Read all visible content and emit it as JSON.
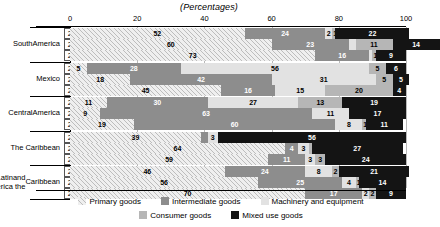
{
  "title": "(Percentages)",
  "axis": {
    "ticks": [
      0,
      20,
      40,
      60,
      80,
      100
    ],
    "min": 0,
    "max": 100
  },
  "legend": {
    "items": [
      {
        "label": "Primary goods",
        "key": "primary",
        "color": "#efefef"
      },
      {
        "label": "Intermediate goods",
        "key": "intermediate",
        "color": "#8d8d8d"
      },
      {
        "label": "Machinery and equipment",
        "key": "machinery",
        "color": "#e2e2e2"
      },
      {
        "label": "Consumer goods",
        "key": "consumer",
        "color": "#b6b6b6"
      },
      {
        "label": "Mixed use goods",
        "key": "mixed",
        "color": "#141414"
      }
    ]
  },
  "groups": [
    {
      "name": "South America",
      "label_lines": [
        "South",
        "America"
      ]
    },
    {
      "name": "Mexico",
      "label_lines": [
        "Mexico"
      ]
    },
    {
      "name": "Central America",
      "label_lines": [
        "Central",
        "America"
      ]
    },
    {
      "name": "The Caribbean",
      "label_lines": [
        "The Caribbean"
      ]
    },
    {
      "name": "Latin America and the Caribbean",
      "label_lines": [
        "Latin America",
        "and the",
        "Caribbean"
      ]
    }
  ],
  "chart_data": {
    "type": "bar",
    "orientation": "horizontal",
    "stacked": true,
    "title": "(Percentages)",
    "xlabel": "",
    "ylabel": "",
    "xlim": [
      0,
      100
    ],
    "grid": true,
    "legend_position": "bottom",
    "categories": [
      "Primary goods",
      "Intermediate goods",
      "Machinery and equipment",
      "Consumer goods",
      "Mixed use goods"
    ],
    "rows": [
      {
        "group": "South America",
        "year": "2000",
        "values": [
          52,
          24,
          2,
          1,
          22
        ],
        "labels": [
          "52",
          "24",
          "2",
          "1",
          "22"
        ]
      },
      {
        "group": "South America",
        "year": "2005",
        "values": [
          60,
          23,
          2,
          11,
          14
        ],
        "labels": [
          "60",
          "23",
          "",
          "11",
          "14"
        ]
      },
      {
        "group": "South America",
        "year": "2013",
        "values": [
          73,
          16,
          1,
          1,
          9
        ],
        "labels": [
          "73",
          "16",
          "",
          "1",
          "9"
        ]
      },
      {
        "group": "Mexico",
        "year": "2000",
        "values": [
          5,
          28,
          56,
          5,
          6
        ],
        "labels": [
          "5",
          "28",
          "56",
          "5",
          "6"
        ]
      },
      {
        "group": "Mexico",
        "year": "2005",
        "values": [
          18,
          42,
          31,
          5,
          5
        ],
        "labels": [
          "18",
          "42",
          "31",
          "5",
          "5"
        ]
      },
      {
        "group": "Mexico",
        "year": "2013",
        "values": [
          45,
          16,
          15,
          20,
          4
        ],
        "labels": [
          "45",
          "16",
          "15",
          "20",
          "4"
        ]
      },
      {
        "group": "Central America",
        "year": "2000",
        "values": [
          11,
          30,
          27,
          13,
          19
        ],
        "labels": [
          "11",
          "30",
          "27",
          "13",
          "19"
        ]
      },
      {
        "group": "Central America",
        "year": "2005",
        "values": [
          9,
          63,
          11,
          0,
          17
        ],
        "labels": [
          "9",
          "63",
          "11",
          "",
          "17"
        ]
      },
      {
        "group": "Central America",
        "year": "2013",
        "values": [
          19,
          60,
          8,
          1,
          11
        ],
        "labels": [
          "19",
          "60",
          "8",
          "1",
          "11"
        ]
      },
      {
        "group": "The Caribbean",
        "year": "2000",
        "values": [
          39,
          2,
          3,
          0,
          56
        ],
        "labels": [
          "39",
          "",
          "3",
          "",
          "56"
        ]
      },
      {
        "group": "The Caribbean",
        "year": "2005",
        "values": [
          64,
          4,
          3,
          1,
          27
        ],
        "labels": [
          "64",
          "4",
          "3",
          "",
          "27"
        ]
      },
      {
        "group": "The Caribbean",
        "year": "2013",
        "values": [
          59,
          11,
          3,
          3,
          24
        ],
        "labels": [
          "59",
          "11",
          "3",
          "3",
          "24"
        ]
      },
      {
        "group": "Latin America and the Caribbean",
        "year": "2000",
        "values": [
          46,
          24,
          8,
          2,
          21
        ],
        "labels": [
          "46",
          "24",
          "8",
          "2",
          "21"
        ]
      },
      {
        "group": "Latin America and the Caribbean",
        "year": "2005",
        "values": [
          56,
          25,
          4,
          1,
          14
        ],
        "labels": [
          "56",
          "25",
          "4",
          "1",
          "14"
        ]
      },
      {
        "group": "Latin America and the Caribbean",
        "year": "2013",
        "values": [
          70,
          17,
          2,
          2,
          9
        ],
        "labels": [
          "70",
          "17",
          "2",
          "2",
          "9"
        ]
      }
    ]
  }
}
